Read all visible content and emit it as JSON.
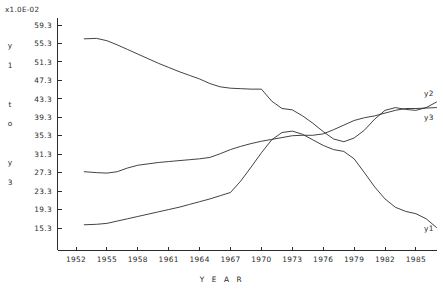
{
  "chart_data": {
    "type": "line",
    "title": "",
    "subtitle": "",
    "xlabel": "Y E A R",
    "ylabel": "y1 to y3",
    "ylabel_chars": [
      "y",
      "1",
      "",
      "t",
      "o",
      "",
      "y",
      "3"
    ],
    "unit_multiplier": "x1.0E-02",
    "grid": false,
    "legend_position": "right-inline",
    "xlim": [
      1952,
      1987
    ],
    "ylim": [
      13.3,
      61.3
    ],
    "x_ticks": [
      1952,
      1955,
      1958,
      1961,
      1964,
      1967,
      1970,
      1973,
      1976,
      1979,
      1982,
      1985
    ],
    "x_tick_labels": [
      "1952",
      "1955",
      "1958",
      "1961",
      "1964",
      "1967",
      "1970",
      "1973",
      "1976",
      "1979",
      "1982",
      "1985"
    ],
    "y_ticks": [
      15.3,
      19.3,
      23.3,
      27.3,
      31.3,
      35.3,
      39.3,
      43.3,
      47.3,
      51.3,
      55.3,
      59.3
    ],
    "y_tick_labels": [
      "59.3",
      "55.3",
      "51.3",
      "47.3",
      "43.3",
      "39.3",
      "35.3",
      "31.3",
      "27.3",
      "23.3",
      "19.3",
      "15.3"
    ],
    "x": [
      1952.8,
      1954,
      1955,
      1956,
      1957,
      1958,
      1959,
      1960,
      1961,
      1962,
      1963,
      1964,
      1965,
      1966,
      1967,
      1968,
      1969,
      1970,
      1971,
      1972,
      1973,
      1974,
      1975,
      1976,
      1977,
      1978,
      1979,
      1980,
      1981,
      1982,
      1983,
      1984,
      1985,
      1986,
      1987
    ],
    "series": [
      {
        "name": "y1",
        "label": "y1",
        "label_position": "end",
        "values": [
          16.0,
          16.1,
          16.3,
          16.8,
          17.3,
          17.8,
          18.3,
          18.8,
          19.3,
          19.8,
          20.4,
          21.0,
          21.6,
          22.3,
          23.0,
          25.5,
          28.5,
          31.6,
          34.4,
          36.0,
          36.3,
          35.6,
          34.4,
          33.2,
          32.3,
          31.9,
          30.3,
          27.3,
          24.2,
          21.6,
          19.8,
          18.9,
          18.4,
          17.3,
          15.4
        ]
      },
      {
        "name": "y2",
        "label": "y2",
        "label_position": "end",
        "values": [
          56.3,
          56.4,
          55.9,
          55.0,
          54.0,
          53.0,
          52.0,
          51.0,
          50.1,
          49.2,
          48.4,
          47.6,
          46.6,
          45.9,
          45.6,
          45.5,
          45.4,
          45.4,
          42.8,
          41.2,
          40.9,
          39.6,
          38.0,
          36.2,
          34.6,
          34.0,
          34.8,
          36.5,
          38.9,
          40.8,
          41.4,
          41.0,
          40.8,
          41.4,
          42.6
        ]
      },
      {
        "name": "y3",
        "label": "y3",
        "label_position": "end",
        "values": [
          27.5,
          27.3,
          27.2,
          27.5,
          28.3,
          28.9,
          29.2,
          29.5,
          29.7,
          29.9,
          30.1,
          30.3,
          30.6,
          31.4,
          32.3,
          33.0,
          33.6,
          34.1,
          34.5,
          34.9,
          35.3,
          35.4,
          35.4,
          35.7,
          36.6,
          37.6,
          38.6,
          39.2,
          39.6,
          40.2,
          40.8,
          41.2,
          41.2,
          41.3,
          41.4
        ]
      }
    ]
  },
  "labels": {
    "unit_multiplier": "x1.0E-02",
    "x_axis_title": "Y E A R",
    "series_y1": "y1",
    "series_y2": "y2",
    "series_y3": "y3"
  }
}
